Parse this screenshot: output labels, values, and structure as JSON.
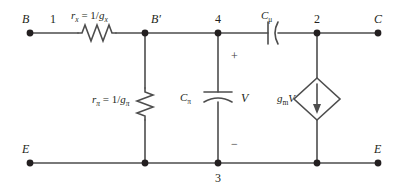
{
  "figure": {
    "kind": "circuit-schematic",
    "line_color": "#4d4d4d",
    "node_dot_color": "#231f20",
    "background": "#ffffff"
  },
  "terminals": {
    "base": "B",
    "collector": "C",
    "emitter_left": "E",
    "emitter_right": "E"
  },
  "nodes": {
    "n1": "1",
    "n_bprime": "B′",
    "n4": "4",
    "n2": "2",
    "n3": "3"
  },
  "components": {
    "rx": {
      "symbol": "resistor-zigzag",
      "label_r": "r",
      "label_r_sub": "x",
      "label_eq": " = 1/",
      "label_g": "g",
      "label_g_sub": "x"
    },
    "rpi": {
      "symbol": "resistor-zigzag",
      "label_r": "r",
      "label_r_sub": "π",
      "label_eq": " = 1/",
      "label_g": "g",
      "label_g_sub": "π"
    },
    "cpi": {
      "symbol": "capacitor-curved",
      "label_c": "C",
      "label_c_sub": "π"
    },
    "cmu": {
      "symbol": "capacitor-curved",
      "label_c": "C",
      "label_c_sub": "μ"
    },
    "vcvs": {
      "symbol": "dependent-current-source-diamond",
      "label_g": "g",
      "label_g_sub": "m",
      "label_v": "V",
      "arrow_direction": "down"
    }
  },
  "voltage_label": {
    "name": "V",
    "plus": "+",
    "minus": "−"
  }
}
